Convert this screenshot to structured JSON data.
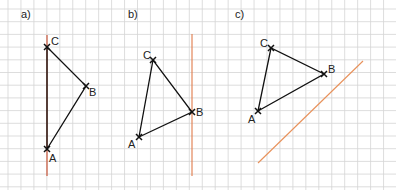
{
  "panels": [
    {
      "label": "a)",
      "points": {
        "A": "A",
        "B": "B",
        "C": "C"
      }
    },
    {
      "label": "b)",
      "points": {
        "A": "A",
        "B": "B",
        "C": "C"
      }
    },
    {
      "label": "c)",
      "points": {
        "A": "A",
        "B": "B",
        "C": "C"
      }
    }
  ],
  "colors": {
    "grid": "#d0d0d0",
    "triangle": "#111111",
    "axis": "#e07a4a"
  }
}
